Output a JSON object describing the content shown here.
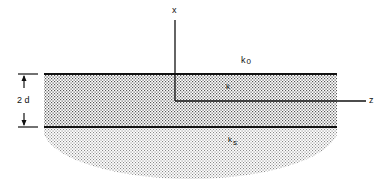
{
  "diagram": {
    "axes": {
      "x_label": "x",
      "z_label": "z"
    },
    "regions": {
      "cover": {
        "label": "k",
        "sub": "0"
      },
      "film": {
        "label": "k",
        "sub": ""
      },
      "substrate": {
        "label": "k",
        "sub": "s"
      }
    },
    "dimension": {
      "label": "2 d"
    },
    "colors": {
      "line": "#111111",
      "film_dots": "#555555",
      "substrate_dots": "#8a8a8a"
    }
  }
}
